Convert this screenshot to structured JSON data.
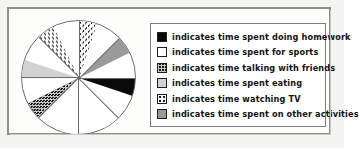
{
  "figure": {
    "kind": "pie-chart-with-legend",
    "border_color": "#8e8e8e"
  },
  "legend": {
    "title": "",
    "entries": [
      {
        "label": "indicates time spent doing homework",
        "swatch": "solid-black-swatch",
        "pattern": "solid",
        "color": "#0a0a0a"
      },
      {
        "label": "indicates time spent for sports",
        "swatch": "white-swatch",
        "pattern": "solid",
        "color": "#ffffff"
      },
      {
        "label": "indicates time talking with friends",
        "swatch": "dark-grid-swatch",
        "pattern": "crosshatch",
        "color": "#161616"
      },
      {
        "label": "indicates time spent eating",
        "swatch": "light-gray-swatch",
        "pattern": "solid",
        "color": "#d2d2d2"
      },
      {
        "label": "indicates time watching TV",
        "swatch": "dotted-swatch",
        "pattern": "dots",
        "color": "#fbfbfb"
      },
      {
        "label": "indicates time spent on other activities",
        "swatch": "medium-gray-swatch",
        "pattern": "solid",
        "color": "#9a9a9a"
      }
    ]
  },
  "chart_data": {
    "type": "pie",
    "title": "",
    "xlabel": "",
    "ylabel": "",
    "legend_position": "right",
    "grid": false,
    "total_segments": 8,
    "segment_angle_deg": 45,
    "categories": [
      "time spent doing homework",
      "time spent for sports",
      "time talking with friends",
      "time spent eating",
      "time watching TV",
      "time spent on other activities"
    ],
    "values": [
      12.5,
      25,
      12.5,
      12.5,
      25,
      12.5
    ],
    "value_unit": "percent",
    "segments_clockwise_from_top": [
      {
        "index": 0,
        "start_deg": 0,
        "end_deg": 45,
        "category": "time spent doing homework",
        "pattern": "solid",
        "color": "#0a0a0a"
      },
      {
        "index": 1,
        "start_deg": 45,
        "end_deg": 90,
        "category": "time spent for sports",
        "pattern": "solid",
        "color": "#ffffff"
      },
      {
        "index": 2,
        "start_deg": 90,
        "end_deg": 135,
        "category": "time spent for sports",
        "pattern": "solid",
        "color": "#ffffff"
      },
      {
        "index": 3,
        "start_deg": 135,
        "end_deg": 180,
        "category": "time talking with friends",
        "pattern": "crosshatch",
        "color": "#161616"
      },
      {
        "index": 4,
        "start_deg": 180,
        "end_deg": 225,
        "category": "time spent eating",
        "pattern": "solid",
        "color": "#d2d2d2"
      },
      {
        "index": 5,
        "start_deg": 225,
        "end_deg": 270,
        "category": "time watching TV",
        "pattern": "dots",
        "color": "#fbfbfb"
      },
      {
        "index": 6,
        "start_deg": 270,
        "end_deg": 315,
        "category": "time watching TV",
        "pattern": "dots",
        "color": "#fbfbfb"
      },
      {
        "index": 7,
        "start_deg": 315,
        "end_deg": 360,
        "category": "time spent on other activities",
        "pattern": "solid",
        "color": "#9a9a9a"
      }
    ]
  }
}
